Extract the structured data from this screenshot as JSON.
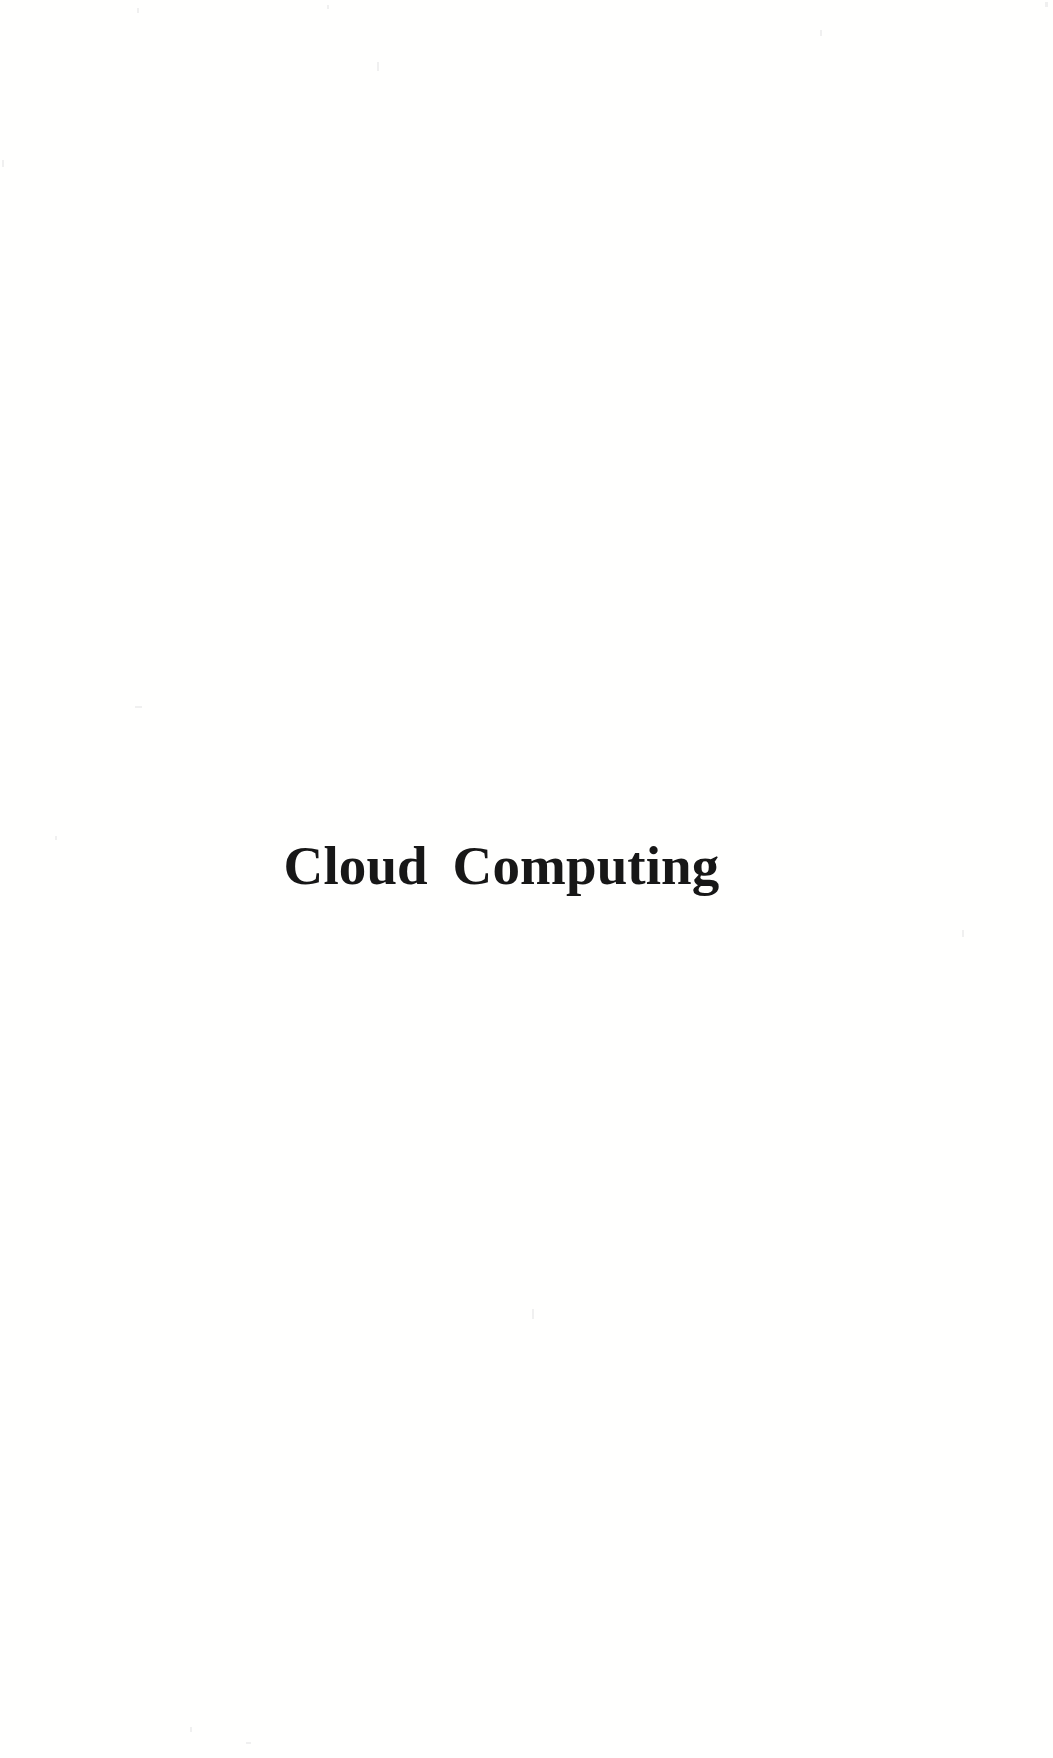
{
  "document": {
    "kind": "book-section-divider-page",
    "page_background_color": "#fffffe",
    "text_color": "#171717"
  },
  "title": {
    "text": "Cloud Computing"
  },
  "body": {
    "content": ""
  },
  "footer": {
    "page_number": ""
  }
}
